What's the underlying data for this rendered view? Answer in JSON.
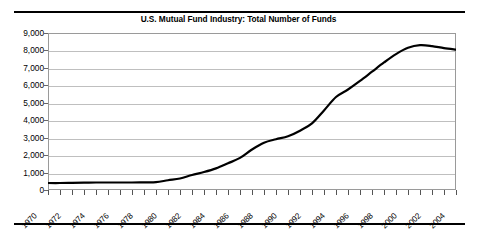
{
  "figure": {
    "title": "U.S. Mutual Fund Industry: Total Number of Funds",
    "rule_color": "#000000",
    "background": "#ffffff"
  },
  "chart_data": {
    "type": "line",
    "title": "U.S. Mutual Fund Industry: Total Number of Funds",
    "xlabel": "",
    "ylabel": "",
    "xlim": [
      1970,
      2004
    ],
    "ylim": [
      0,
      9000
    ],
    "grid": true,
    "legend": "none",
    "line_color": "#000000",
    "grid_color": "#bfbfbf",
    "y_ticks": [
      0,
      1000,
      2000,
      3000,
      4000,
      5000,
      6000,
      7000,
      8000,
      9000
    ],
    "y_tick_labels": [
      "0",
      "1,000",
      "2,000",
      "3,000",
      "4,000",
      "5,000",
      "6,000",
      "7,000",
      "8,000",
      "9,000"
    ],
    "x_ticks": [
      1970,
      1971,
      1972,
      1973,
      1974,
      1975,
      1976,
      1977,
      1978,
      1979,
      1980,
      1981,
      1982,
      1983,
      1984,
      1985,
      1986,
      1987,
      1988,
      1989,
      1990,
      1991,
      1992,
      1993,
      1994,
      1995,
      1996,
      1997,
      1998,
      1999,
      2000,
      2001,
      2002,
      2003,
      2004
    ],
    "x_tick_labels": [
      "1970",
      "1972",
      "1974",
      "1976",
      "1978",
      "1980",
      "1982",
      "1984",
      "1986",
      "1988",
      "1990",
      "1992",
      "1994",
      "1996",
      "1998",
      "2000",
      "2002",
      "2004"
    ],
    "x_label_values": [
      1970,
      1972,
      1974,
      1976,
      1978,
      1980,
      1982,
      1984,
      1986,
      1988,
      1990,
      1992,
      1994,
      1996,
      1998,
      2000,
      2002,
      2004
    ],
    "x": [
      1970,
      1971,
      1972,
      1973,
      1974,
      1975,
      1976,
      1977,
      1978,
      1979,
      1980,
      1981,
      1982,
      1983,
      1984,
      1985,
      1986,
      1987,
      1988,
      1989,
      1990,
      1991,
      1992,
      1993,
      1994,
      1995,
      1996,
      1997,
      1998,
      1999,
      2000,
      2001,
      2002,
      2003,
      2004
    ],
    "values": [
      400,
      400,
      410,
      420,
      430,
      430,
      430,
      430,
      440,
      450,
      560,
      660,
      860,
      1030,
      1240,
      1530,
      1840,
      2320,
      2710,
      2910,
      3080,
      3400,
      3820,
      4560,
      5330,
      5760,
      6250,
      6780,
      7310,
      7790,
      8150,
      8300,
      8250,
      8130,
      8050
    ],
    "annotations": []
  }
}
